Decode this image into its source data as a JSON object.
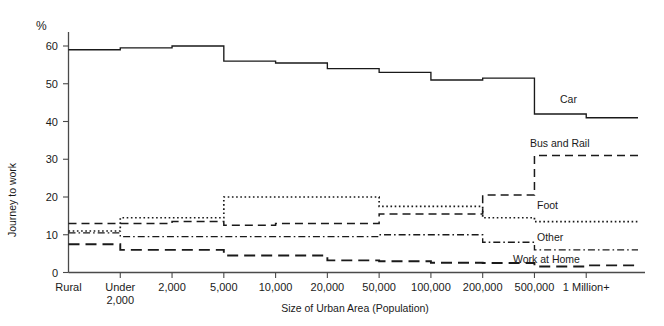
{
  "chart_data": {
    "type": "line",
    "title": "",
    "xlabel": "Size of Urban Area (Population)",
    "ylabel": "Journey to work",
    "unit_label": "%",
    "categories": [
      "Rural",
      "Under 2,000",
      "2,000",
      "5,000",
      "10,000",
      "20,000",
      "50,000",
      "100,000",
      "200,000",
      "500,000",
      "1 Million+"
    ],
    "tick_labels": [
      "Rural",
      "Under\n2,000",
      "2,000",
      "5,000",
      "10,000",
      "20,000",
      "50,000",
      "100,000",
      "200,000",
      "500,000",
      "1 Million+"
    ],
    "ylim": [
      0,
      62
    ],
    "yticks": [
      0,
      10,
      20,
      30,
      40,
      50,
      60
    ],
    "ytick_labels": [
      "0",
      "10",
      "20",
      "30",
      "40",
      "50",
      "60"
    ],
    "grid": false,
    "legend_position": "inline-right",
    "step_style": "post",
    "series": [
      {
        "name": "Car",
        "label": "Car",
        "dash": "solid",
        "values": [
          59.0,
          59.5,
          60.0,
          56.0,
          55.5,
          54.0,
          53.0,
          51.0,
          51.5,
          42.0,
          41.0
        ],
        "label_x": 560,
        "label_y": 103
      },
      {
        "name": "Bus and Rail",
        "label": "Bus and Rail",
        "dash": "dashed",
        "values": [
          13.0,
          13.0,
          13.5,
          12.5,
          13.0,
          13.0,
          15.5,
          15.5,
          20.5,
          31.0,
          31.0
        ],
        "label_x": 530,
        "label_y": 147
      },
      {
        "name": "Foot",
        "label": "Foot",
        "dash": "dotted",
        "values": [
          11.0,
          14.5,
          14.5,
          20.0,
          20.0,
          20.0,
          17.5,
          17.5,
          14.5,
          13.5,
          13.5
        ],
        "label_x": 537,
        "label_y": 209
      },
      {
        "name": "Other",
        "label": "Other",
        "dash": "dashdot",
        "values": [
          10.5,
          9.5,
          9.5,
          9.5,
          9.5,
          9.5,
          10.0,
          10.0,
          8.0,
          6.0,
          6.0
        ],
        "label_x": 537,
        "label_y": 241
      },
      {
        "name": "Work at Home",
        "label": "Work at Home",
        "dash": "longdash",
        "values": [
          7.5,
          6.0,
          6.0,
          4.5,
          4.5,
          3.2,
          3.0,
          2.6,
          2.5,
          1.6,
          1.9
        ],
        "label_x": 513,
        "label_y": 263
      }
    ]
  },
  "colors": {
    "ink": "#1a1a1a",
    "axis": "#4a4a4a",
    "background": "#ffffff"
  }
}
